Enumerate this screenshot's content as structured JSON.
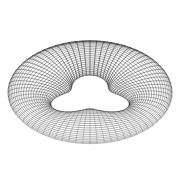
{
  "figure": {
    "title": "Wireframe torus with trefoil inner hole",
    "background_color": "#ffffff",
    "line_color": "#2a2a2a",
    "canvas": {
      "width": 181,
      "height": 190
    }
  },
  "chart_data": {
    "type": "line",
    "title": "Wireframe torus with trefoil inner hole",
    "subtitle": "",
    "xlabel": "",
    "ylabel": "",
    "grid": false,
    "legend_position": "none",
    "projection": "orthographic-tilted",
    "surface": {
      "name": "trefoil-torus",
      "center_x": 90,
      "center_y": 97,
      "outer_radius_x": 82,
      "outer_radius_y": 82,
      "inner_radius_x": 33,
      "inner_radius_y": 27,
      "hole_lobes": 3,
      "hole_lobe_depth": 0.3,
      "hole_rotation_deg": -90,
      "tilt": 0.62,
      "vertical_offset": 13,
      "bulge": 0.34
    },
    "mesh": {
      "meridian_count": 72,
      "parallel_count": 26,
      "meridian_label": "radial spokes",
      "parallel_label": "concentric rings",
      "stroke_width_min": 0.28,
      "stroke_width_max": 0.62,
      "opacity_min": 0.38,
      "opacity_max": 0.95
    },
    "x": [
      0,
      90,
      181
    ],
    "values": [
      97,
      15,
      97
    ],
    "xlim": [
      0,
      181
    ],
    "ylim": [
      0,
      190
    ]
  }
}
